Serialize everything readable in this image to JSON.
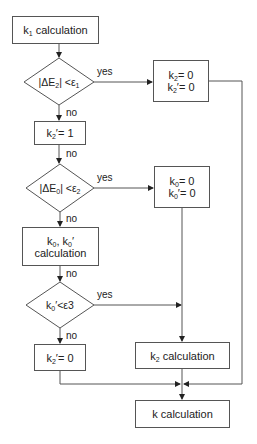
{
  "diagram": {
    "type": "flowchart",
    "nodes": {
      "k1_calc": {
        "main": "k",
        "sub": "1",
        "rest": " calculation"
      },
      "dec1": {
        "text": "|ΔE2| < ε1",
        "a": "|ΔE",
        "a_sub": "2",
        "b": "| <ε",
        "b_sub": "1"
      },
      "k2_zero": {
        "l1a": "k",
        "l1s": "2",
        "l1b": "= 0",
        "l2a": "k",
        "l2s": "2",
        "l2b": "′= 0"
      },
      "k2p_one": {
        "a": "k",
        "s": "2",
        "b": "′= 1"
      },
      "dec2": {
        "text": "|ΔE0| < ε2",
        "a": "|ΔE",
        "a_sub": "0",
        "b": "| <ε",
        "b_sub": "2"
      },
      "k0_zero": {
        "l1a": "k",
        "l1s": "0",
        "l1b": "= 0",
        "l2a": "k",
        "l2s": "0",
        "l2b": "′= 0"
      },
      "k0_calc": {
        "l1a": "k",
        "l1s": "0",
        "l1b": ", k",
        "l1s2": "0",
        "l1c": "′",
        "l2": "calculation"
      },
      "dec3": {
        "text": "k0′ < ε3",
        "a": "k",
        "s": "0",
        "b": "′<ε3"
      },
      "k2p_zero": {
        "a": "k",
        "s": "2",
        "b": "′= 0"
      },
      "k2_calc": {
        "a": "k",
        "s": "2",
        "b": " calculation"
      },
      "k_calc": {
        "text": "k calculation"
      }
    },
    "edge_labels": {
      "yes1": "yes",
      "no1": "no",
      "no1b": "no",
      "yes2": "yes",
      "no2": "no",
      "no2b": "no",
      "yes3": "yes",
      "no3": "no"
    },
    "colors": {
      "line": "#555555",
      "fill": "#ffffff",
      "text": "#222222"
    }
  }
}
